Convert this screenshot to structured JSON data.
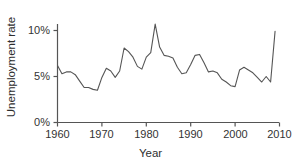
{
  "chart_data": {
    "type": "line",
    "title": "",
    "xlabel": "Year",
    "ylabel": "Unemployment rate",
    "xlim": [
      1960,
      2010
    ],
    "ylim": [
      0,
      11.5
    ],
    "grid": false,
    "legend": "none",
    "line_color": "#555555",
    "axis_color": "#555555",
    "xticks": [
      1960,
      1970,
      1980,
      1990,
      2000,
      2010
    ],
    "xticklabels": [
      "1960",
      "1970",
      "1980",
      "1990",
      "2000",
      "2010"
    ],
    "yticks": [
      0,
      5,
      10
    ],
    "yticklabels": [
      "0%",
      "5%",
      "10%"
    ],
    "x": [
      1960,
      1961,
      1962,
      1963,
      1964,
      1965,
      1966,
      1967,
      1968,
      1969,
      1970,
      1971,
      1972,
      1973,
      1974,
      1975,
      1976,
      1977,
      1978,
      1979,
      1980,
      1981,
      1982,
      1983,
      1984,
      1985,
      1986,
      1987,
      1988,
      1989,
      1990,
      1991,
      1992,
      1993,
      1994,
      1995,
      1996,
      1997,
      1998,
      1999,
      2000,
      2001,
      2002,
      2003,
      2004,
      2005,
      2006,
      2007,
      2008,
      2009
    ],
    "values": [
      6.2,
      5.3,
      5.5,
      5.5,
      5.2,
      4.5,
      3.8,
      3.8,
      3.6,
      3.5,
      4.9,
      5.9,
      5.6,
      4.9,
      5.6,
      8.1,
      7.7,
      7.1,
      6.1,
      5.8,
      7.1,
      7.6,
      10.7,
      8.2,
      7.3,
      7.2,
      7.0,
      6.0,
      5.3,
      5.4,
      6.3,
      7.3,
      7.4,
      6.5,
      5.5,
      5.6,
      5.4,
      4.7,
      4.4,
      4.0,
      3.9,
      5.7,
      6.0,
      5.7,
      5.4,
      4.9,
      4.4,
      5.0,
      4.4,
      9.9
    ],
    "series_name": "Unemployment rate"
  }
}
